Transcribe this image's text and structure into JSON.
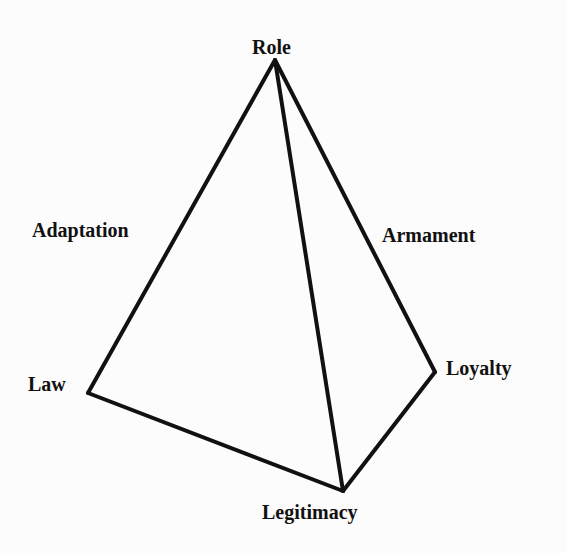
{
  "diagram": {
    "type": "tetrahedron",
    "stroke_color": "#111111",
    "background_color": "#fcfcfc",
    "vertices": {
      "top": {
        "label": "Role",
        "x": 275,
        "y": 60
      },
      "left": {
        "label": "Law",
        "x": 88,
        "y": 393
      },
      "right": {
        "label": "Loyalty",
        "x": 435,
        "y": 372
      },
      "bottom": {
        "label": "Legitimacy",
        "x": 343,
        "y": 491
      }
    },
    "edge_labels": {
      "left_edge": "Adaptation",
      "right_edge": "Armament"
    },
    "edges": [
      [
        "top",
        "left"
      ],
      [
        "top",
        "right"
      ],
      [
        "top",
        "bottom"
      ],
      [
        "left",
        "bottom"
      ],
      [
        "right",
        "bottom"
      ]
    ]
  }
}
